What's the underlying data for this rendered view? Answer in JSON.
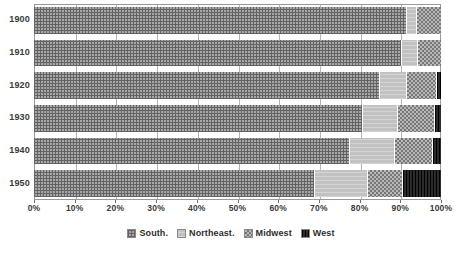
{
  "chart_data": {
    "type": "bar",
    "orientation": "horizontal",
    "stacked": true,
    "normalized": true,
    "title": "",
    "subtitle": "",
    "xlabel": "",
    "ylabel": "",
    "xlim": [
      0,
      100
    ],
    "grid": true,
    "legend_position": "bottom",
    "categories": [
      "1900",
      "1910",
      "1920",
      "1930",
      "1940",
      "1950"
    ],
    "x_ticks": [
      "0%",
      "10%",
      "20%",
      "30%",
      "40%",
      "50%",
      "60%",
      "70%",
      "80%",
      "90%",
      "100%"
    ],
    "x_tick_values": [
      0,
      10,
      20,
      30,
      40,
      50,
      60,
      70,
      80,
      90,
      100
    ],
    "series": [
      {
        "name": "South.",
        "pattern": "cross-hatch-grid",
        "color": "#a8a8a8",
        "values": [
          91.6,
          90.4,
          85.0,
          80.8,
          77.6,
          69.0
        ]
      },
      {
        "name": "Northeast.",
        "pattern": "light-solid",
        "color": "#c2c2c2",
        "values": [
          2.5,
          3.9,
          6.6,
          8.6,
          11.1,
          13.0
        ]
      },
      {
        "name": "Midwest",
        "pattern": "checkerboard",
        "color": "#9b9b9b",
        "values": [
          5.9,
          5.7,
          7.4,
          9.1,
          9.3,
          8.6
        ]
      },
      {
        "name": "West",
        "pattern": "solid-dark",
        "color": "#1d1d1d",
        "values": [
          0.0,
          0.0,
          1.0,
          1.5,
          2.0,
          9.4
        ]
      }
    ]
  }
}
